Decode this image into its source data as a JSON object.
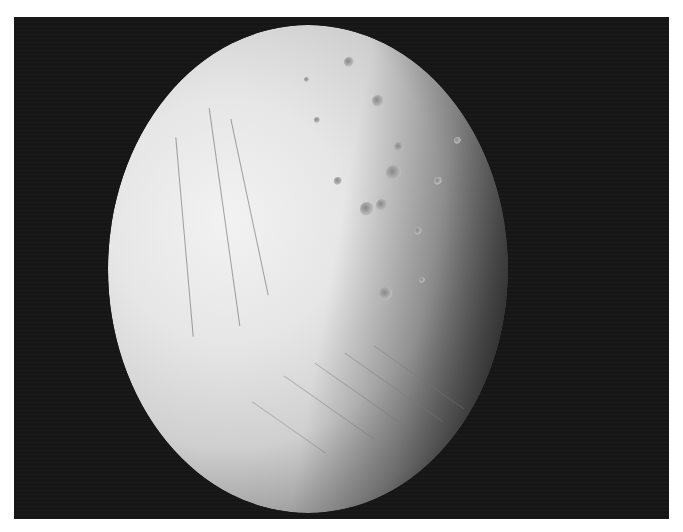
{
  "image": {
    "subject": "Enceladus (icy moon) partial globe against black space",
    "description": "Grayscale photograph of a cratered, fractured icy moon; heavily cratered northern region, tiger-stripe-like parallel ridges in the lower region, night side shading to the right",
    "colors": {
      "background": "#ffffff",
      "space": "#161616",
      "surface_light": "#efefef",
      "surface_shadow": "#4a4a4a"
    }
  }
}
